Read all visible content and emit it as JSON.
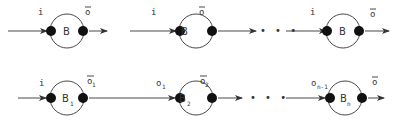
{
  "diagram": {
    "rows": [
      {
        "name": "identical-chain",
        "blocks": [
          {
            "label": "B",
            "sub": "",
            "input": "i",
            "input_sub": "",
            "output": "o",
            "output_sub": "",
            "output_bar": true
          },
          {
            "label": "B",
            "sub": "",
            "input": "i",
            "input_sub": "",
            "output": "o",
            "output_sub": "",
            "output_bar": true
          },
          {
            "label": "B",
            "sub": "",
            "input": "i",
            "input_sub": "",
            "output": "o",
            "output_sub": "",
            "output_bar": true
          }
        ],
        "ellipsis": "• • •"
      },
      {
        "name": "composed-chain",
        "blocks": [
          {
            "label": "B",
            "sub": "1",
            "input": "i",
            "input_sub": "",
            "output": "o",
            "output_sub": "1",
            "output_bar": true
          },
          {
            "label": "B",
            "sub": "2",
            "input": "o",
            "input_sub": "1",
            "output": "o",
            "output_sub": "2",
            "output_bar": true
          },
          {
            "label": "B",
            "sub": "n",
            "input": "o",
            "input_sub": "n-1",
            "output": "o",
            "output_sub": "",
            "output_bar": true
          }
        ],
        "ellipsis": "• • •"
      }
    ]
  }
}
